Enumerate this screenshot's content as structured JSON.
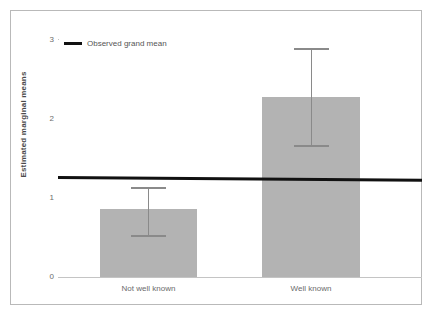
{
  "chart_data": {
    "type": "bar",
    "title": "",
    "xlabel": "",
    "ylabel": "Estimated marginal means",
    "categories": [
      "Not well known",
      "Well known"
    ],
    "values": [
      0.86,
      2.28
    ],
    "series": [
      {
        "name": "Estimated marginal means",
        "values": [
          0.86,
          2.28
        ]
      }
    ],
    "error_bars": {
      "type": "ci",
      "lower": [
        0.53,
        1.67
      ],
      "upper": [
        1.14,
        2.9
      ]
    },
    "reference_line": {
      "label": "Observed grand mean",
      "value": 1.27,
      "color": "#111111"
    },
    "ylim": [
      0,
      3
    ],
    "yticks": [
      "3",
      "2",
      "1",
      "0"
    ],
    "ytick_values": [
      3,
      2,
      1,
      0
    ],
    "grid": false,
    "legend": {
      "position": "top-left",
      "entries": [
        {
          "label": "Observed grand mean",
          "marker": "line",
          "color": "#111111"
        }
      ]
    },
    "colors": {
      "bar_fill": "#b3b3b3",
      "error_bar": "#8a8a8a",
      "axis": "#c4c4c4",
      "tick_text": "#6b6b6b",
      "axis_title": "#4a4a4a",
      "reference_line": "#111111",
      "frame": "#b9b9b9",
      "background": "#ffffff"
    }
  },
  "axis": {
    "y_title": "Estimated marginal means",
    "y_tick_3": "3",
    "y_tick_2": "2",
    "y_tick_1": "1",
    "y_tick_0": "0"
  },
  "legend": {
    "grand_mean_label": "Observed grand mean"
  },
  "categories": {
    "cat_0": "Not well known",
    "cat_1": "Well known"
  }
}
